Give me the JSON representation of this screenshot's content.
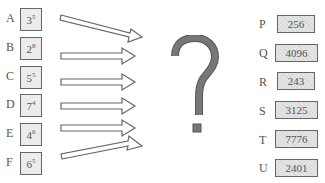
{
  "left_items": [
    {
      "label": "A",
      "base": "3",
      "exp": "5"
    },
    {
      "label": "B",
      "base": "2",
      "exp": "8"
    },
    {
      "label": "C",
      "base": "5",
      "exp": "5"
    },
    {
      "label": "D",
      "base": "7",
      "exp": "4"
    },
    {
      "label": "E",
      "base": "4",
      "exp": "6"
    },
    {
      "label": "F",
      "base": "6",
      "exp": "5"
    }
  ],
  "center_symbol": "?",
  "right_items": [
    {
      "label": "P",
      "value": "256"
    },
    {
      "label": "Q",
      "value": "4096"
    },
    {
      "label": "R",
      "value": "243"
    },
    {
      "label": "S",
      "value": "3125"
    },
    {
      "label": "T",
      "value": "7776"
    },
    {
      "label": "U",
      "value": "2401"
    }
  ],
  "colors": {
    "box_border": "#666666",
    "left_box_fill": "#ececec",
    "right_box_fill": "#dcdcdc",
    "question_mark": "#666666"
  }
}
